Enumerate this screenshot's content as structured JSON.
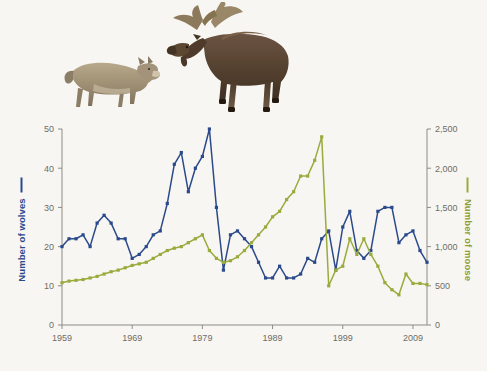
{
  "figure": {
    "background_color": "#f8f6f2",
    "photos": [
      {
        "name": "wolf-photo",
        "alt": "Gray wolf standing in profile"
      },
      {
        "name": "moose-photo",
        "alt": "Bull moose with antlers standing in profile"
      }
    ]
  },
  "chart_data": {
    "type": "line",
    "title": "",
    "xlabel": "",
    "ylabel": "Number of wolves",
    "y2label": "Number of moose",
    "grid": false,
    "legend_position": "axis-labels",
    "xlim": [
      1959,
      2011
    ],
    "ylim": [
      0,
      50
    ],
    "y2lim": [
      0,
      2500
    ],
    "xticks": [
      1959,
      1969,
      1979,
      1989,
      1999,
      2009
    ],
    "xtick_labels": [
      "1959",
      "1969",
      "1979",
      "1989",
      "1999",
      "2009"
    ],
    "yticks": [
      0,
      10,
      20,
      30,
      40,
      50
    ],
    "ytick_labels": [
      "0",
      "10",
      "20",
      "30",
      "40",
      "50"
    ],
    "y2ticks": [
      0,
      500,
      1000,
      1500,
      2000,
      2500
    ],
    "y2tick_labels": [
      "0",
      "500",
      "1,000",
      "1,500",
      "2,000",
      "2,500"
    ],
    "x": [
      1959,
      1960,
      1961,
      1962,
      1963,
      1964,
      1965,
      1966,
      1967,
      1968,
      1969,
      1970,
      1971,
      1972,
      1973,
      1974,
      1975,
      1976,
      1977,
      1978,
      1979,
      1980,
      1981,
      1982,
      1983,
      1984,
      1985,
      1986,
      1987,
      1988,
      1989,
      1990,
      1991,
      1992,
      1993,
      1994,
      1995,
      1996,
      1997,
      1998,
      1999,
      2000,
      2001,
      2002,
      2003,
      2004,
      2005,
      2006,
      2007,
      2008,
      2009,
      2010,
      2011
    ],
    "series": [
      {
        "name": "Number of wolves",
        "axis": "left",
        "color": "#2b4a8b",
        "marker": "square",
        "values": [
          20,
          22,
          22,
          23,
          20,
          26,
          28,
          26,
          22,
          22,
          17,
          18,
          20,
          23,
          24,
          31,
          41,
          44,
          34,
          40,
          43,
          50,
          30,
          14,
          23,
          24,
          22,
          20,
          16,
          12,
          12,
          15,
          12,
          12,
          13,
          17,
          16,
          22,
          24,
          14,
          25,
          29,
          19,
          17,
          19,
          29,
          30,
          30,
          21,
          23,
          24,
          19,
          16
        ]
      },
      {
        "name": "Number of moose",
        "axis": "right",
        "color": "#9aab3e",
        "marker": "square",
        "values": [
          540,
          560,
          570,
          580,
          600,
          620,
          650,
          680,
          700,
          730,
          760,
          780,
          800,
          850,
          900,
          950,
          980,
          1000,
          1050,
          1100,
          1150,
          950,
          850,
          800,
          820,
          870,
          950,
          1050,
          1150,
          1250,
          1380,
          1450,
          1600,
          1700,
          1900,
          1900,
          2100,
          2400,
          500,
          700,
          750,
          1100,
          900,
          1100,
          900,
          750,
          540,
          450,
          385,
          650,
          530,
          530,
          515
        ]
      }
    ],
    "annotations": []
  }
}
